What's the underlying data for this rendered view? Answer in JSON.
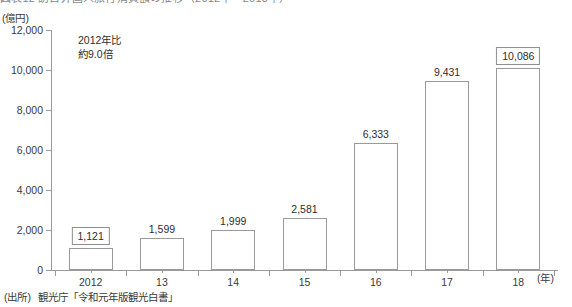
{
  "figure": {
    "title_clipped": "図表12  訪日外国人旅行消費額の推移（2012年～2018年）",
    "y_axis_unit": "(億円)",
    "x_axis_unit": "(年)",
    "annotation_line1": "2012年比",
    "annotation_line2": "約9.0倍",
    "source_prefix": "(出所)",
    "source_text": "観光庁「令和元年版観光白書」"
  },
  "chart_data": {
    "type": "bar",
    "title": "図表12  訪日外国人旅行消費額の推移（2012年～2018年）",
    "xlabel": "(年)",
    "ylabel": "(億円)",
    "ylim": [
      0,
      12000
    ],
    "ytick_values": [
      0,
      2000,
      4000,
      6000,
      8000,
      10000,
      12000
    ],
    "ytick_labels": [
      "0",
      "2,000",
      "4,000",
      "6,000",
      "8,000",
      "10,000",
      "12,000"
    ],
    "grid": false,
    "legend": null,
    "categories": [
      "2012",
      "13",
      "14",
      "15",
      "16",
      "17",
      "18"
    ],
    "values": [
      1121,
      1599,
      1999,
      2581,
      6333,
      9431,
      10086
    ],
    "value_labels": [
      "1,121",
      "1,599",
      "1,999",
      "2,581",
      "6,333",
      "9,431",
      "10,086"
    ],
    "boxed_labels": [
      true,
      false,
      false,
      false,
      false,
      false,
      true
    ],
    "annotations": [
      "2012年比",
      "約9.0倍"
    ],
    "bar_style": {
      "fill": "#ffffff",
      "edge": "#9a9a9a"
    }
  }
}
